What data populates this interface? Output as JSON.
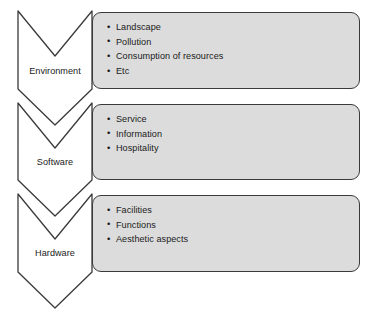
{
  "diagram": {
    "box_fill_color": "#dcdcdc",
    "outline_color": "#3a3a3a",
    "background_color": "#ffffff",
    "rows": [
      {
        "label": "Environment",
        "items": [
          "Landscape",
          "Pollution",
          "Consumption of resources",
          "Etc"
        ]
      },
      {
        "label": "Software",
        "items": [
          "Service",
          "Information",
          "Hospitality"
        ]
      },
      {
        "label": "Hardware",
        "items": [
          "Facilities",
          "Functions",
          "Aesthetic aspects"
        ]
      }
    ]
  }
}
